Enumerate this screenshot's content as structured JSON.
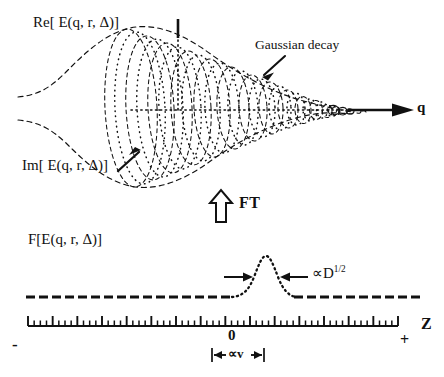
{
  "figure": {
    "title_hidden": "",
    "panels": [
      {
        "id": "top-panel",
        "description": "Complex field E(q,r,Delta) drawn as a decaying helix inside a Gaussian envelope along the q axis",
        "axis_label": "q",
        "labels": {
          "real_part": "Re[ E(q, r, Δ)]",
          "imag_part": "Im[ E(q, r, Δ)]",
          "envelope_note": "Gaussian decay"
        }
      },
      {
        "id": "bottom-panel",
        "description": "Fourier transform of E plotted against Z with a narrow Gaussian peak at Z = 0",
        "axis_label": "Z",
        "labels": {
          "function": "F[E(q, r, Δ)]",
          "width_note": "∝D",
          "width_exponent": "1/2",
          "velocity_note": "∝v",
          "axis_minus": "-",
          "axis_zero": "0",
          "axis_plus": "+"
        }
      }
    ],
    "transform_arrow": {
      "glyph": "⇑",
      "label": "FT"
    },
    "colors": {
      "ink": "#111111",
      "paper": "#ffffff"
    }
  },
  "chart_data": {
    "type": "line",
    "charts": [
      {
        "id": "top-panel",
        "type": "line",
        "xlabel": "q",
        "ylabel": "Re[ E(q, r, Δ)]",
        "secondary_ylabel": "Im[ E(q, r, Δ)]",
        "grid": false,
        "legend": "none",
        "annotations": [
          "Gaussian decay"
        ],
        "envelope": {
          "form": "gaussian",
          "peak_x": 0.0,
          "amplitude": 1.0,
          "decay": "amplitude falls monotonically toward large q"
        },
        "helix_rings": 12,
        "ring_widths_relative": [
          1.0,
          0.95,
          0.86,
          0.76,
          0.65,
          0.55,
          0.45,
          0.36,
          0.28,
          0.2,
          0.13,
          0.07
        ]
      },
      {
        "id": "bottom-panel",
        "type": "line",
        "xlabel": "Z",
        "ylabel": "F[E(q, r, Δ)]",
        "grid": false,
        "legend": "none",
        "xlim": [
          -1,
          1
        ],
        "xticks": [
          "-",
          "0",
          "+"
        ],
        "peak": {
          "center": 0,
          "shape": "gaussian",
          "width_scaling": "∝D^{1/2}",
          "baseline": "flat dashed line"
        },
        "annotations": [
          "∝D^{1/2}",
          "∝v"
        ],
        "tick_major_count": 15,
        "tick_minor_per_major": 3
      }
    ]
  }
}
